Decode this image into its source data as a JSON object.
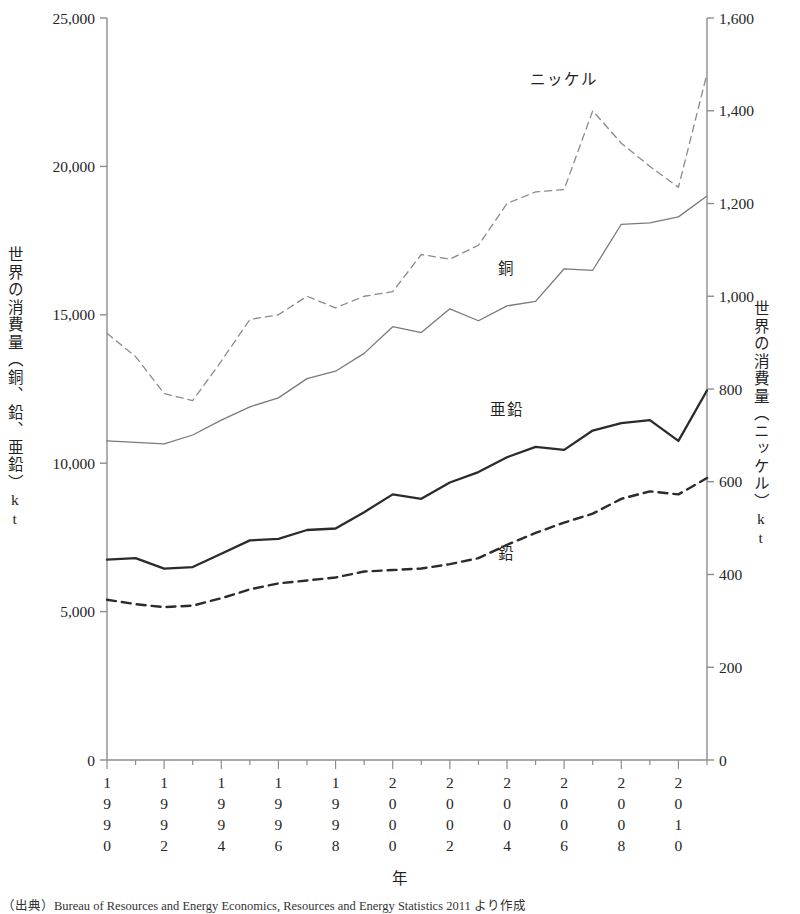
{
  "chart_data": {
    "type": "line",
    "title": "",
    "xlabel": "年",
    "ylabel": "世界の消費量（銅、鉛、亜鉛）kt",
    "y2label": "世界の消費量（ニッケル）kt",
    "grid": false,
    "legend_position": "inline-annotations",
    "x": [
      1990,
      1991,
      1992,
      1993,
      1994,
      1995,
      1996,
      1997,
      1998,
      1999,
      2000,
      2001,
      2002,
      2003,
      2004,
      2005,
      2006,
      2007,
      2008,
      2009,
      2010,
      2011
    ],
    "xlim": [
      1990,
      2011
    ],
    "xtick_labels": [
      "1990",
      "1992",
      "1994",
      "1996",
      "1998",
      "2000",
      "2002",
      "2004",
      "2006",
      "2008",
      "2010"
    ],
    "xticks": [
      1990,
      1992,
      1994,
      1996,
      1998,
      2000,
      2002,
      2004,
      2006,
      2008,
      2010
    ],
    "ylim": [
      0,
      25000
    ],
    "yticks": [
      0,
      5000,
      10000,
      15000,
      20000,
      25000
    ],
    "ytick_labels": [
      "0",
      "5,000",
      "10,000",
      "15,000",
      "20,000",
      "25,000"
    ],
    "y2lim": [
      0,
      1600
    ],
    "y2ticks": [
      0,
      200,
      400,
      600,
      800,
      1000,
      1200,
      1400,
      1600
    ],
    "y2tick_labels": [
      "0",
      "200",
      "400",
      "600",
      "800",
      "1,000",
      "1,200",
      "1,400",
      "1,600"
    ],
    "series": [
      {
        "name": "銅",
        "axis": "left",
        "style": "thin-solid",
        "color": "#7a7a7a",
        "label_x": 2004,
        "label_y": 16600,
        "values": [
          10750,
          10700,
          10650,
          10950,
          11450,
          11900,
          12200,
          12850,
          13100,
          13700,
          14600,
          14400,
          15200,
          14800,
          15300,
          15450,
          16550,
          16500,
          18050,
          18100,
          18300,
          19000
        ]
      },
      {
        "name": "亜鉛",
        "axis": "left",
        "style": "thick-solid",
        "color": "#2b2b2b",
        "label_x": 2004,
        "label_y": 11850,
        "values": [
          6750,
          6800,
          6450,
          6500,
          6950,
          7400,
          7450,
          7750,
          7800,
          8350,
          8950,
          8800,
          9350,
          9700,
          10200,
          10550,
          10450,
          11100,
          11350,
          11450,
          10750,
          12450
        ]
      },
      {
        "name": "鉛",
        "axis": "left",
        "style": "thick-dashed",
        "color": "#2b2b2b",
        "label_x": 2004,
        "label_y": 7000,
        "values": [
          5400,
          5250,
          5150,
          5200,
          5450,
          5750,
          5950,
          6050,
          6150,
          6350,
          6400,
          6450,
          6600,
          6800,
          7250,
          7650,
          8000,
          8300,
          8800,
          9050,
          8950,
          9500
        ]
      },
      {
        "name": "ニッケル",
        "axis": "right",
        "style": "thin-dashed",
        "color": "#8a8a8a",
        "label_x": 2006,
        "label_y": 1470,
        "values": [
          920,
          870,
          790,
          775,
          860,
          950,
          960,
          1000,
          975,
          1000,
          1010,
          1090,
          1080,
          1110,
          1200,
          1225,
          1230,
          1400,
          1330,
          1280,
          1235,
          1480
        ]
      }
    ]
  },
  "source": {
    "note": "（出典）Bureau of Resources and Energy Economics, Resources and Energy Statistics 2011 より作成"
  }
}
